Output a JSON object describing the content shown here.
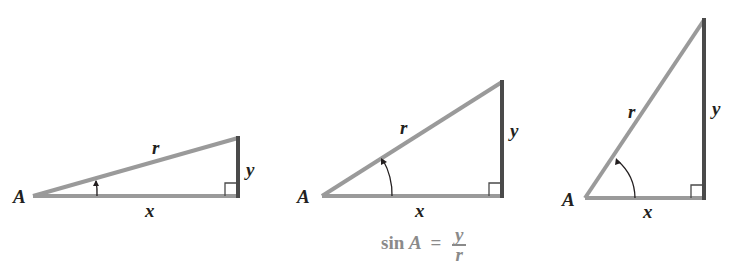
{
  "colors": {
    "hypotenuse_and_adjacent": "#9a9a9a",
    "opposite": "#4a4a4a",
    "label": "#231f20",
    "formula": "#8a8a8a"
  },
  "triangles": [
    {
      "vertex_label": "A",
      "hypotenuse_label": "r",
      "opposite_label": "y",
      "adjacent_label": "x",
      "angle_marker": "small-angle-arc"
    },
    {
      "vertex_label": "A",
      "hypotenuse_label": "r",
      "opposite_label": "y",
      "adjacent_label": "x",
      "angle_marker": "medium-angle-arc"
    },
    {
      "vertex_label": "A",
      "hypotenuse_label": "r",
      "opposite_label": "y",
      "adjacent_label": "x",
      "angle_marker": "large-angle-arc"
    }
  ],
  "formula": {
    "function": "sin",
    "variable": "A",
    "equals": "=",
    "numerator": "y",
    "denominator": "r"
  }
}
